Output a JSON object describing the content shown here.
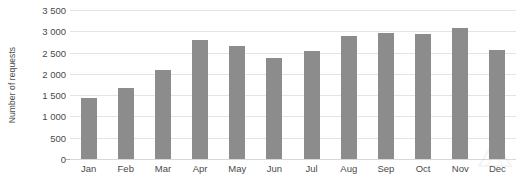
{
  "chart_data": {
    "type": "bar",
    "title": "",
    "xlabel": "",
    "ylabel": "Number of requests",
    "categories": [
      "Jan",
      "Feb",
      "Mar",
      "Apr",
      "May",
      "Jun",
      "Jul",
      "Aug",
      "Sep",
      "Oct",
      "Nov",
      "Dec"
    ],
    "values": [
      1430,
      1670,
      2100,
      2790,
      2650,
      2380,
      2540,
      2880,
      2950,
      2930,
      3080,
      2560
    ],
    "series": [
      {
        "name": "Number of requests",
        "values": [
          1430,
          1670,
          2100,
          2790,
          2650,
          2380,
          2540,
          2880,
          2950,
          2930,
          3080,
          2560
        ]
      }
    ],
    "ylim": [
      0,
      3500
    ],
    "ytick_values": [
      0,
      500,
      1000,
      1500,
      2000,
      2500,
      3000,
      3500
    ],
    "ytick_labels": [
      "0",
      "500",
      "1 000",
      "1 500",
      "2 000",
      "2 500",
      "3 000",
      "3 500"
    ],
    "grid": true,
    "legend": false,
    "bar_color": "#8c8c8c",
    "gridline_color": "#e4e4e4",
    "text_color": "#4a4a4a",
    "background_color": "#ffffff"
  },
  "watermark": {
    "name": "faint-watermark-mark"
  }
}
